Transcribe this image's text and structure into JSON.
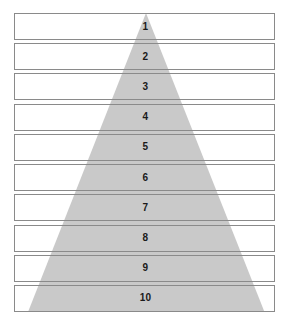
{
  "diagram": {
    "type": "pyramid",
    "title": "",
    "orientation": "apex-top",
    "level_count": 10,
    "shape_name": "shaded-triangle",
    "colors": {
      "triangle_fill": "#c9c9c9",
      "box_border": "#8a8a8a",
      "box_fill": "#ffffff",
      "label_text": "#1a1a1a",
      "background": "#ffffff"
    },
    "levels": [
      {
        "label": "1"
      },
      {
        "label": "2"
      },
      {
        "label": "3"
      },
      {
        "label": "4"
      },
      {
        "label": "5"
      },
      {
        "label": "6"
      },
      {
        "label": "7"
      },
      {
        "label": "8"
      },
      {
        "label": "9"
      },
      {
        "label": "10"
      }
    ]
  }
}
